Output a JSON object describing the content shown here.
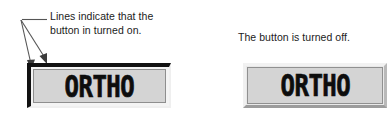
{
  "figure": {
    "type": "annotated-ui-illustration",
    "background_color": "#ffffff"
  },
  "annotation": {
    "name": "on-state-callout",
    "line_1": "Lines indicate that the",
    "line_2": "button in turned on.",
    "leader": {
      "style": "two-pronged arrow with horizontal stem",
      "color": "#4a4a4a",
      "stem_from_x": 22,
      "stem_to_x": 46,
      "stem_y": 19,
      "arrow_1_tip_x": 30,
      "arrow_1_tip_y": 68,
      "arrow_2_tip_x": 45,
      "arrow_2_tip_y": 63
    }
  },
  "caption": {
    "name": "off-state-caption",
    "text": "The button is turned off."
  },
  "buttons": [
    {
      "id": "ortho-on",
      "label": "ORTHO",
      "state": "on",
      "state_description": "Lines indicate that the button in turned on.",
      "face_color": "#d4d4d4",
      "indicator_color": "#111111",
      "text_color": "#0d0d0d"
    },
    {
      "id": "ortho-off",
      "label": "ORTHO",
      "state": "off",
      "state_description": "The button is turned off.",
      "face_color": "#d4d4d4",
      "bevel_light_color": "#f2f2f2",
      "bevel_shadow_color": "#9c9c9c",
      "text_color": "#0d0d0d"
    }
  ]
}
